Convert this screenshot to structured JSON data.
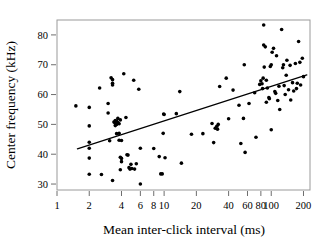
{
  "chart_data": {
    "type": "scatter",
    "title": "",
    "xlabel": "Mean inter-click interval (ms)",
    "ylabel": "Center frequency (kHz)",
    "xscale": "log",
    "yscale": "linear",
    "xlim": [
      1.0,
      230.0
    ],
    "ylim": [
      28.0,
      85.0
    ],
    "grid": false,
    "legend": null,
    "xticks": [
      1,
      2,
      4,
      6,
      8,
      10,
      20,
      40,
      60,
      80,
      100,
      200
    ],
    "xticklabels": [
      "1",
      "2",
      "4",
      "6",
      "8",
      "10",
      "20",
      "40",
      "60",
      "80",
      "100",
      "200"
    ],
    "yticks": [
      30,
      40,
      50,
      60,
      70,
      80
    ],
    "yticklabels": [
      "30",
      "40",
      "50",
      "60",
      "70",
      "80"
    ],
    "marker": {
      "shape": "circle",
      "color": "#000000",
      "size_px": 2.6
    },
    "points": [
      [
        1.5,
        56.2
      ],
      [
        2.0,
        55.7
      ],
      [
        2.0,
        49.5
      ],
      [
        2.0,
        44.0
      ],
      [
        2.0,
        42.0
      ],
      [
        2.0,
        38.7
      ],
      [
        2.0,
        33.3
      ],
      [
        2.5,
        62.2
      ],
      [
        2.6,
        33.2
      ],
      [
        3.0,
        57.0
      ],
      [
        3.0,
        53.8
      ],
      [
        3.1,
        44.5
      ],
      [
        3.2,
        65.6
      ],
      [
        3.3,
        65.0
      ],
      [
        3.3,
        63.8
      ],
      [
        3.3,
        63.2
      ],
      [
        3.3,
        31.2
      ],
      [
        3.4,
        50.8
      ],
      [
        3.5,
        51.3
      ],
      [
        3.5,
        50.4
      ],
      [
        3.5,
        49.6
      ],
      [
        3.6,
        51.0
      ],
      [
        3.6,
        50.0
      ],
      [
        3.6,
        46.9
      ],
      [
        3.7,
        52.0
      ],
      [
        3.7,
        50.6
      ],
      [
        3.8,
        50.2
      ],
      [
        3.8,
        47.0
      ],
      [
        3.8,
        44.7
      ],
      [
        3.9,
        51.5
      ],
      [
        3.9,
        39.0
      ],
      [
        3.9,
        34.8
      ],
      [
        4.0,
        38.6
      ],
      [
        4.0,
        37.5
      ],
      [
        4.0,
        44.6
      ],
      [
        4.2,
        67.0
      ],
      [
        4.4,
        52.3
      ],
      [
        4.5,
        39.8
      ],
      [
        4.6,
        39.7
      ],
      [
        4.7,
        35.5
      ],
      [
        4.8,
        35.0
      ],
      [
        4.9,
        36.6
      ],
      [
        5.0,
        35.2
      ],
      [
        5.2,
        64.8
      ],
      [
        5.3,
        35.0
      ],
      [
        5.5,
        36.8
      ],
      [
        5.8,
        61.8
      ],
      [
        6.0,
        42.0
      ],
      [
        6.0,
        30.0
      ],
      [
        8.0,
        41.9
      ],
      [
        9.0,
        39.2
      ],
      [
        9.3,
        33.4
      ],
      [
        9.6,
        33.4
      ],
      [
        9.8,
        47.0
      ],
      [
        9.9,
        53.5
      ],
      [
        10.0,
        53.3
      ],
      [
        10.2,
        38.8
      ],
      [
        13.0,
        53.6
      ],
      [
        14.0,
        61.0
      ],
      [
        14.5,
        37.0
      ],
      [
        18.0,
        46.7
      ],
      [
        23.0,
        46.9
      ],
      [
        28.0,
        50.3
      ],
      [
        29.0,
        43.9
      ],
      [
        30.0,
        48.7
      ],
      [
        31.0,
        49.4
      ],
      [
        31.5,
        48.4
      ],
      [
        32.0,
        50.0
      ],
      [
        33.0,
        62.7
      ],
      [
        38.0,
        65.5
      ],
      [
        40.0,
        51.9
      ],
      [
        44.0,
        61.5
      ],
      [
        50.0,
        56.4
      ],
      [
        52.0,
        43.6
      ],
      [
        55.0,
        52.0
      ],
      [
        56.0,
        70.0
      ],
      [
        57.0,
        40.6
      ],
      [
        62.0,
        57.0
      ],
      [
        70.0,
        60.6
      ],
      [
        72.0,
        45.7
      ],
      [
        78.0,
        63.4
      ],
      [
        80.0,
        64.6
      ],
      [
        82.0,
        63.6
      ],
      [
        83.0,
        62.0
      ],
      [
        84.0,
        65.5
      ],
      [
        85.0,
        76.6
      ],
      [
        85.0,
        83.3
      ],
      [
        86.0,
        69.2
      ],
      [
        88.0,
        76.0
      ],
      [
        90.0,
        64.8
      ],
      [
        90.0,
        57.4
      ],
      [
        92.0,
        62.2
      ],
      [
        95.0,
        59.0
      ],
      [
        96.0,
        58.6
      ],
      [
        98.0,
        69.4
      ],
      [
        100.0,
        70.0
      ],
      [
        100.0,
        48.2
      ],
      [
        102.0,
        74.2
      ],
      [
        105.0,
        75.5
      ],
      [
        108.0,
        61.0
      ],
      [
        110.0,
        60.4
      ],
      [
        112.0,
        73.0
      ],
      [
        115.0,
        58.0
      ],
      [
        118.0,
        62.8
      ],
      [
        120.0,
        55.0
      ],
      [
        125.0,
        81.8
      ],
      [
        128.0,
        69.0
      ],
      [
        130.0,
        70.0
      ],
      [
        132.0,
        63.0
      ],
      [
        135.0,
        60.0
      ],
      [
        138.0,
        66.5
      ],
      [
        140.0,
        71.5
      ],
      [
        145.0,
        61.6
      ],
      [
        150.0,
        69.8
      ],
      [
        152.0,
        58.2
      ],
      [
        158.0,
        64.0
      ],
      [
        162.0,
        61.2
      ],
      [
        168.0,
        70.4
      ],
      [
        172.0,
        62.0
      ],
      [
        175.0,
        63.8
      ],
      [
        180.0,
        77.8
      ],
      [
        185.0,
        70.8
      ],
      [
        188.0,
        63.2
      ],
      [
        195.0,
        72.2
      ],
      [
        200.0,
        66.0
      ]
    ],
    "fit_line": {
      "type": "linear-on-log-x",
      "x_start": 1.55,
      "y_start": 41.8,
      "x_end": 215.0,
      "y_end": 66.6,
      "color": "#000000",
      "width_px": 1.2
    }
  },
  "axes": {
    "frame_color": "#9a9a9a",
    "tick_color": "#6e6e6e",
    "text_color": "#000000"
  }
}
